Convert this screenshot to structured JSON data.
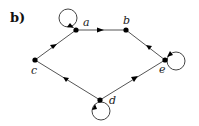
{
  "panel_label": "b)",
  "nodes": [
    {
      "id": "a",
      "label": "a",
      "x": 76,
      "y": 30
    },
    {
      "id": "b",
      "label": "b",
      "x": 126,
      "y": 30
    },
    {
      "id": "c",
      "label": "c",
      "x": 35,
      "y": 60
    },
    {
      "id": "d",
      "label": "d",
      "x": 100,
      "y": 100
    },
    {
      "id": "e",
      "label": "e",
      "x": 165,
      "y": 60
    }
  ],
  "edges": [
    {
      "from": "a",
      "to": "b"
    },
    {
      "from": "e",
      "to": "b"
    },
    {
      "from": "d",
      "to": "e"
    },
    {
      "from": "d",
      "to": "c"
    },
    {
      "from": "c",
      "to": "a"
    }
  ],
  "self_loops": [
    "a",
    "e",
    "d"
  ]
}
